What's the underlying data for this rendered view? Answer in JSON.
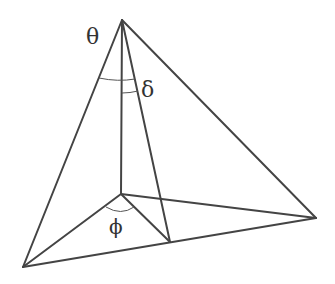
{
  "diagram": {
    "type": "tetrahedron-angle-figure",
    "stroke_color": "#444444",
    "background": "#ffffff",
    "vertices": {
      "apex": [
        122,
        20
      ],
      "base_center": [
        121,
        194
      ],
      "left": [
        23,
        267
      ],
      "right": [
        316,
        218
      ],
      "inner": [
        170,
        242
      ]
    },
    "labels": {
      "theta": "θ",
      "delta": "δ",
      "phi": "ϕ"
    }
  }
}
